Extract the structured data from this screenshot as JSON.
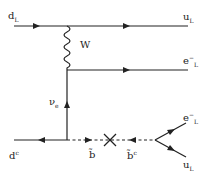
{
  "diagram": {
    "type": "feynman",
    "boson": {
      "label": "W"
    },
    "particles": {
      "d_L": {
        "main": "d",
        "sub": "L"
      },
      "u_L_top": {
        "main": "u",
        "sub": "L"
      },
      "e_L_mid": {
        "main": "e",
        "sup": "−",
        "sub": "L"
      },
      "nu_e": {
        "main": "ν",
        "sub": "e"
      },
      "d_c": {
        "main": "d",
        "sup": "c"
      },
      "b_tilde": {
        "main": "b̃",
        "sup": ""
      },
      "b_tilde_c": {
        "main": "b̃",
        "sup": "c"
      },
      "e_L_out": {
        "main": "e",
        "sup": "−",
        "sub": "L"
      },
      "u_L_out": {
        "main": "u",
        "sub": "L"
      }
    },
    "colors": {
      "line": "#222222",
      "background": "#ffffff"
    }
  }
}
